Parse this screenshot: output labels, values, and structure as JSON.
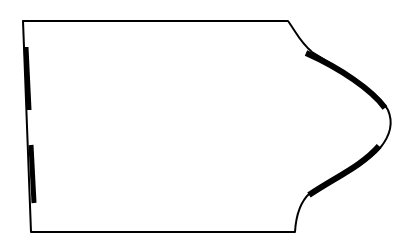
{
  "diagram": {
    "type": "pattern-piece-outline",
    "colors": {
      "background": "#ffffff",
      "stroke": "#000000"
    },
    "outline_stroke_width": 2,
    "marker_stroke_width": 6,
    "labels": []
  }
}
